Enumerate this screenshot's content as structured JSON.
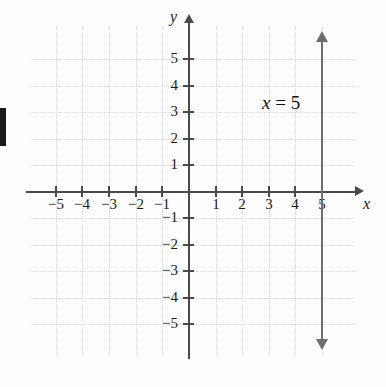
{
  "figure": {
    "kind": "cartesian-coordinate-plane",
    "axis_labels": {
      "x": "x",
      "y": "y"
    },
    "equation_label": {
      "variable": "x",
      "relation": "=",
      "value": "5",
      "full": "x = 5"
    },
    "margin_artifact": "l"
  },
  "chart_data": {
    "type": "line",
    "title": "",
    "xlabel": "x",
    "ylabel": "y",
    "grid": true,
    "legend": "none",
    "annotations": [
      {
        "text": "x = 5",
        "x": 3.0,
        "y": 3.6
      }
    ],
    "xlim": [
      -6,
      6
    ],
    "ylim": [
      -6,
      6
    ],
    "xticks": [
      -5,
      -4,
      -3,
      -2,
      -1,
      1,
      2,
      3,
      4,
      5
    ],
    "yticks": [
      -5,
      -4,
      -3,
      -2,
      -1,
      1,
      2,
      3,
      4,
      5
    ],
    "xtick_labels": [
      "−5",
      "−4",
      "−3",
      "−2",
      "−1",
      "1",
      "2",
      "3",
      "4",
      "5"
    ],
    "ytick_labels": [
      "−5",
      "−4",
      "−3",
      "−2",
      "−1",
      "1",
      "2",
      "3",
      "4",
      "5"
    ],
    "series": [
      {
        "name": "x = 5",
        "equation": "x = 5",
        "orientation": "vertical",
        "x": [
          5,
          5
        ],
        "y": [
          -5.6,
          5.6
        ],
        "arrows": "both",
        "color": "#6e6e6e"
      }
    ]
  },
  "ticks": {
    "x": [
      {
        "value": -5,
        "label": "−5",
        "px": 56
      },
      {
        "value": -4,
        "label": "−4",
        "px": 82
      },
      {
        "value": -3,
        "label": "−3",
        "px": 109
      },
      {
        "value": -2,
        "label": "−2",
        "px": 136
      },
      {
        "value": -1,
        "label": "−1",
        "px": 162
      },
      {
        "value": 1,
        "label": "1",
        "px": 216
      },
      {
        "value": 2,
        "label": "2",
        "px": 242
      },
      {
        "value": 3,
        "label": "3",
        "px": 269
      },
      {
        "value": 4,
        "label": "4",
        "px": 295
      },
      {
        "value": 5,
        "label": "5",
        "px": 322
      }
    ],
    "y": [
      {
        "value": 5,
        "label": "5",
        "px": 59
      },
      {
        "value": 4,
        "label": "4",
        "px": 86
      },
      {
        "value": 3,
        "label": "3",
        "px": 112
      },
      {
        "value": 2,
        "label": "2",
        "px": 139
      },
      {
        "value": 1,
        "label": "1",
        "px": 165
      },
      {
        "value": -1,
        "label": "−1",
        "px": 218
      },
      {
        "value": -2,
        "label": "−2",
        "px": 245
      },
      {
        "value": -3,
        "label": "−3",
        "px": 271
      },
      {
        "value": -4,
        "label": "−4",
        "px": 298
      },
      {
        "value": -5,
        "label": "−5",
        "px": 324
      }
    ]
  },
  "colors": {
    "axis": "#4a4a4a",
    "grid": "#d8d8d8",
    "plot_line": "#6e6e6e",
    "text": "#1a1a1a",
    "background": "#fefefe"
  }
}
